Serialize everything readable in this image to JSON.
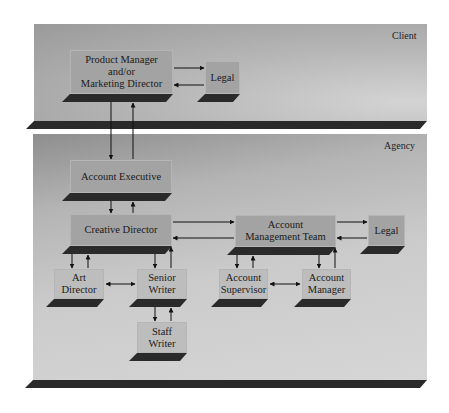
{
  "diagram": {
    "type": "organization-flow",
    "groups": [
      {
        "id": "client",
        "label": "Client"
      },
      {
        "id": "agency",
        "label": "Agency"
      }
    ],
    "nodes": {
      "product_manager": {
        "label": "Product Manager\nand/or\nMarketing Director",
        "group": "client"
      },
      "client_legal": {
        "label": "Legal",
        "group": "client"
      },
      "account_executive": {
        "label": "Account Executive",
        "group": "agency"
      },
      "creative_director": {
        "label": "Creative Director",
        "group": "agency"
      },
      "account_management_team": {
        "label": "Account\nManagement Team",
        "group": "agency"
      },
      "agency_legal": {
        "label": "Legal",
        "group": "agency"
      },
      "art_director": {
        "label": "Art\nDirector",
        "group": "agency"
      },
      "senior_writer": {
        "label": "Senior\nWriter",
        "group": "agency"
      },
      "staff_writer": {
        "label": "Staff\nWriter",
        "group": "agency"
      },
      "account_supervisor": {
        "label": "Account\nSupervisor",
        "group": "agency"
      },
      "account_manager": {
        "label": "Account\nManager",
        "group": "agency"
      }
    },
    "edges": [
      {
        "from": "product_manager",
        "to": "client_legal",
        "bidirectional": true
      },
      {
        "from": "product_manager",
        "to": "account_executive",
        "bidirectional": true
      },
      {
        "from": "account_executive",
        "to": "creative_director",
        "bidirectional": true
      },
      {
        "from": "creative_director",
        "to": "account_management_team",
        "bidirectional": true
      },
      {
        "from": "account_management_team",
        "to": "agency_legal",
        "bidirectional": true
      },
      {
        "from": "creative_director",
        "to": "art_director",
        "bidirectional": true
      },
      {
        "from": "creative_director",
        "to": "senior_writer",
        "bidirectional": true
      },
      {
        "from": "art_director",
        "to": "senior_writer",
        "bidirectional": true
      },
      {
        "from": "senior_writer",
        "to": "staff_writer",
        "bidirectional": true
      },
      {
        "from": "account_management_team",
        "to": "account_supervisor",
        "bidirectional": true
      },
      {
        "from": "account_management_team",
        "to": "account_manager",
        "bidirectional": true
      },
      {
        "from": "account_supervisor",
        "to": "account_manager",
        "bidirectional": true
      }
    ]
  },
  "colors": {
    "box_fill": "#a3a3a3",
    "shadow": "#2a2a2a",
    "arrow": "#111111",
    "background": "#ffffff"
  }
}
